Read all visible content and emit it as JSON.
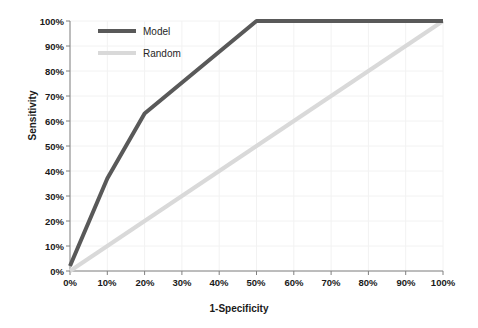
{
  "chart_data": {
    "type": "line",
    "title": "",
    "xlabel": "1-Specificity",
    "ylabel": "Sensitivity",
    "xlim": [
      0,
      100
    ],
    "ylim": [
      0,
      100
    ],
    "grid": true,
    "legend_position": "top-left-inside",
    "x_ticks": [
      "0%",
      "10%",
      "20%",
      "30%",
      "40%",
      "50%",
      "60%",
      "70%",
      "80%",
      "90%",
      "100%"
    ],
    "y_ticks": [
      "0%",
      "10%",
      "20%",
      "30%",
      "40%",
      "50%",
      "60%",
      "70%",
      "80%",
      "90%",
      "100%"
    ],
    "x_tick_values": [
      0,
      10,
      20,
      30,
      40,
      50,
      60,
      70,
      80,
      90,
      100
    ],
    "y_tick_values": [
      0,
      10,
      20,
      30,
      40,
      50,
      60,
      70,
      80,
      90,
      100
    ],
    "series": [
      {
        "name": "Model",
        "color": "#595959",
        "width": 4,
        "x": [
          0,
          10,
          20,
          50,
          100
        ],
        "values": [
          2,
          37,
          63,
          100,
          100
        ]
      },
      {
        "name": "Random",
        "color": "#d9d9d9",
        "width": 4,
        "x": [
          0,
          100
        ],
        "values": [
          0,
          100
        ]
      }
    ]
  },
  "legend": {
    "items": [
      {
        "label": "Model"
      },
      {
        "label": "Random"
      }
    ]
  },
  "colors": {
    "model": "#595959",
    "random": "#d9d9d9",
    "axis": "#808080",
    "grid": "#f2f2f2",
    "text": "#1a1a1a"
  }
}
